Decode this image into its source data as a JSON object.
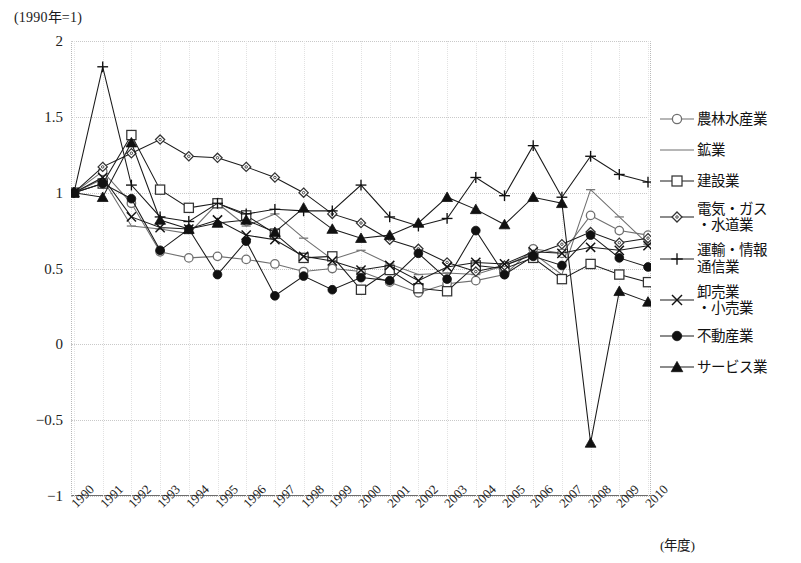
{
  "chart_note": "(1990年=1)",
  "axis": {
    "x_unit_label": "(年度)",
    "y_ticks": [
      "2",
      "1.5",
      "1",
      "0.5",
      "0",
      "-0.5",
      "-1"
    ],
    "x_ticks": [
      "1990",
      "1991",
      "1992",
      "1993",
      "1994",
      "1995",
      "1996",
      "1997",
      "1998",
      "1999",
      "2000",
      "2001",
      "2002",
      "2003",
      "2004",
      "2005",
      "2006",
      "2007",
      "2008",
      "2009",
      "2010"
    ]
  },
  "legend": [
    {
      "label": "農林水産業",
      "marker": "circle-open"
    },
    {
      "label": "鉱業",
      "marker": "line-only"
    },
    {
      "label": "建設業",
      "marker": "square-open"
    },
    {
      "label": "電気・ガス\n・水道業",
      "marker": "diamond-open"
    },
    {
      "label": "運輸・情報\n通信業",
      "marker": "plus"
    },
    {
      "label": "卸売業\n・小売業",
      "marker": "cross"
    },
    {
      "label": "不動産業",
      "marker": "circle-filled"
    },
    {
      "label": "サービス業",
      "marker": "triangle-filled"
    }
  ],
  "chart_data": {
    "type": "line",
    "title": "(1990年=1)",
    "xlabel": "(年度)",
    "ylabel": "",
    "ylim": [
      -1,
      2
    ],
    "grid": true,
    "legend_position": "right",
    "x": [
      1990,
      1991,
      1992,
      1993,
      1994,
      1995,
      1996,
      1997,
      1998,
      1999,
      2000,
      2001,
      2002,
      2003,
      2004,
      2005,
      2006,
      2007,
      2008,
      2009,
      2010
    ],
    "series": [
      {
        "name": "農林水産業",
        "marker": "circle-open",
        "values": [
          1.0,
          1.14,
          0.93,
          0.61,
          0.57,
          0.58,
          0.56,
          0.53,
          0.48,
          0.5,
          0.48,
          0.41,
          0.34,
          0.4,
          0.42,
          0.46,
          0.63,
          0.6,
          0.85,
          0.75,
          0.72
        ]
      },
      {
        "name": "鉱業",
        "marker": "line-only",
        "values": [
          1.0,
          1.09,
          0.78,
          0.76,
          0.73,
          0.93,
          0.78,
          0.86,
          0.7,
          0.56,
          0.62,
          0.53,
          0.46,
          0.47,
          0.46,
          0.52,
          0.6,
          0.46,
          1.02,
          0.84,
          0.66
        ]
      },
      {
        "name": "建設業",
        "marker": "square-open",
        "values": [
          1.0,
          1.06,
          1.38,
          1.02,
          0.9,
          0.93,
          0.85,
          0.73,
          0.57,
          0.58,
          0.36,
          0.49,
          0.37,
          0.35,
          0.52,
          0.5,
          0.57,
          0.43,
          0.53,
          0.46,
          0.41
        ]
      },
      {
        "name": "電気・ガス・水道業",
        "marker": "diamond-open",
        "values": [
          1.0,
          1.17,
          1.26,
          1.35,
          1.24,
          1.23,
          1.17,
          1.1,
          1.0,
          0.86,
          0.8,
          0.69,
          0.63,
          0.54,
          0.48,
          0.52,
          0.59,
          0.66,
          0.74,
          0.67,
          0.7
        ]
      },
      {
        "name": "運輸・情報通信業",
        "marker": "plus",
        "values": [
          1.0,
          1.83,
          1.05,
          0.84,
          0.81,
          0.93,
          0.86,
          0.89,
          0.88,
          0.88,
          1.05,
          0.84,
          0.78,
          0.83,
          1.1,
          0.98,
          1.31,
          0.97,
          1.24,
          1.12,
          1.07
        ]
      },
      {
        "name": "卸売業・小売業",
        "marker": "cross",
        "values": [
          1.0,
          1.1,
          0.84,
          0.77,
          0.76,
          0.82,
          0.72,
          0.69,
          0.58,
          0.55,
          0.49,
          0.52,
          0.42,
          0.51,
          0.54,
          0.53,
          0.61,
          0.6,
          0.64,
          0.62,
          0.65
        ]
      },
      {
        "name": "不動産業",
        "marker": "circle-filled",
        "values": [
          1.0,
          1.06,
          0.96,
          0.62,
          0.76,
          0.46,
          0.68,
          0.32,
          0.45,
          0.36,
          0.44,
          0.42,
          0.6,
          0.43,
          0.75,
          0.46,
          0.58,
          0.52,
          0.72,
          0.57,
          0.51
        ]
      },
      {
        "name": "サービス業",
        "marker": "triangle-filled",
        "values": [
          1.0,
          0.97,
          1.33,
          0.82,
          0.76,
          0.8,
          0.82,
          0.74,
          0.9,
          0.76,
          0.7,
          0.72,
          0.8,
          0.97,
          0.89,
          0.79,
          0.97,
          0.93,
          -0.65,
          0.35,
          0.28
        ]
      }
    ]
  }
}
